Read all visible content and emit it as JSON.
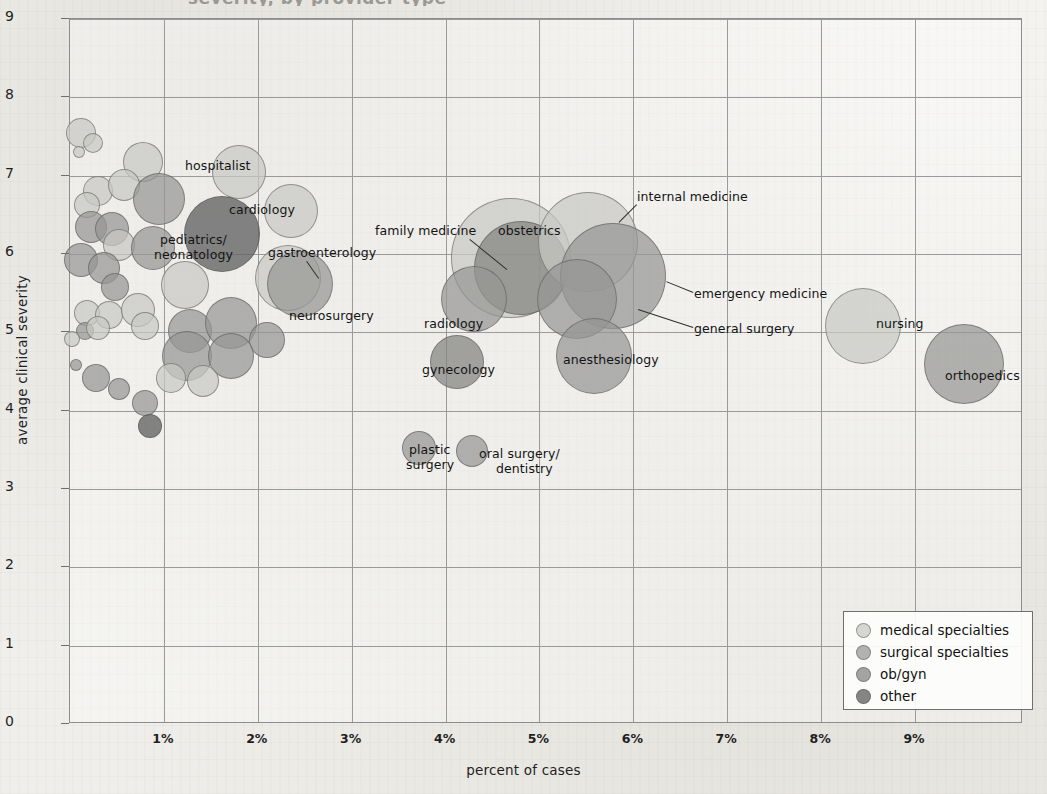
{
  "title_partial": "severity, by provider type",
  "axes": {
    "x": {
      "label": "percent of cases",
      "ticks": [
        "1%",
        "2%",
        "3%",
        "4%",
        "5%",
        "6%",
        "7%",
        "8%",
        "9%"
      ],
      "min": 0,
      "max": 10.15
    },
    "y": {
      "label": "average clinical severity",
      "ticks": [
        "0",
        "1",
        "2",
        "3",
        "4",
        "5",
        "6",
        "7",
        "8",
        "9"
      ],
      "min": 0,
      "max": 9
    }
  },
  "legend": {
    "items": [
      {
        "label": "medical specialties",
        "color": "#c8c8c4",
        "class": "c-med"
      },
      {
        "label": "surgical specialties",
        "color": "#969694",
        "class": "c-surg"
      },
      {
        "label": "ob/gyn",
        "color": "#828280",
        "class": "c-obgyn"
      },
      {
        "label": "other",
        "color": "#636363",
        "class": "c-other"
      }
    ]
  },
  "chart_data": {
    "type": "scatter",
    "title": "severity, by provider type",
    "xlabel": "percent of cases",
    "ylabel": "average clinical severity",
    "xlim": [
      0,
      10.15
    ],
    "ylim": [
      0,
      9
    ],
    "grid": true,
    "legend_position": "bottom-right",
    "size_encodes": "volume of cases",
    "groups": [
      "medical specialties",
      "surgical specialties",
      "ob/gyn",
      "other"
    ],
    "points": [
      {
        "label": "hospitalist",
        "x": 1.8,
        "y": 7.05,
        "r": 27,
        "group": "medical specialties",
        "cls": "c-med"
      },
      {
        "label": "cardiology",
        "x": 2.35,
        "y": 6.55,
        "r": 27,
        "group": "medical specialties",
        "cls": "c-med"
      },
      {
        "label": "pediatrics/\nneonatology",
        "x": 1.62,
        "y": 6.25,
        "r": 38,
        "group": "other",
        "cls": "c-other"
      },
      {
        "label": "gastroenterology",
        "x": 2.32,
        "y": 5.7,
        "r": 33,
        "group": "medical specialties",
        "cls": "c-med"
      },
      {
        "label": "neurosurgery",
        "x": 2.45,
        "y": 5.62,
        "r": 33,
        "group": "surgical specialties",
        "cls": "c-surg"
      },
      {
        "label": "family medicine",
        "x": 4.7,
        "y": 5.95,
        "r": 60,
        "group": "medical specialties",
        "cls": "c-med"
      },
      {
        "label": "obstetrics",
        "x": 4.8,
        "y": 5.82,
        "r": 47,
        "group": "ob/gyn",
        "cls": "c-obgyn"
      },
      {
        "label": "internal medicine",
        "x": 5.52,
        "y": 6.15,
        "r": 50,
        "group": "medical specialties",
        "cls": "c-med"
      },
      {
        "label": "emergency medicine",
        "x": 5.78,
        "y": 5.72,
        "r": 53,
        "group": "medical specialties",
        "cls": "c-surg"
      },
      {
        "label": "general surgery",
        "x": 5.4,
        "y": 5.42,
        "r": 40,
        "group": "surgical specialties",
        "cls": "c-surg"
      },
      {
        "label": "radiology",
        "x": 4.3,
        "y": 5.42,
        "r": 33,
        "group": "medical specialties",
        "cls": "c-surg"
      },
      {
        "label": "gynecology",
        "x": 4.12,
        "y": 4.62,
        "r": 27,
        "group": "ob/gyn",
        "cls": "c-obgyn"
      },
      {
        "label": "anesthesiology",
        "x": 5.58,
        "y": 4.7,
        "r": 38,
        "group": "surgical specialties",
        "cls": "c-surg"
      },
      {
        "label": "nursing",
        "x": 8.45,
        "y": 5.08,
        "r": 38,
        "group": "medical specialties",
        "cls": "c-med"
      },
      {
        "label": "orthopedics",
        "x": 9.52,
        "y": 4.6,
        "r": 40,
        "group": "surgical specialties",
        "cls": "c-surg"
      },
      {
        "label": "plastic\nsurgery",
        "x": 3.72,
        "y": 3.52,
        "r": 17,
        "group": "surgical specialties",
        "cls": "c-surg"
      },
      {
        "label": "oral surgery/\ndentistry",
        "x": 4.28,
        "y": 3.48,
        "r": 16,
        "group": "surgical specialties",
        "cls": "c-surg"
      },
      {
        "label": "",
        "x": 0.12,
        "y": 7.55,
        "r": 15,
        "group": "medical specialties",
        "cls": "c-med"
      },
      {
        "label": "",
        "x": 0.25,
        "y": 7.42,
        "r": 10,
        "group": "medical specialties",
        "cls": "c-med"
      },
      {
        "label": "",
        "x": 0.1,
        "y": 7.3,
        "r": 6,
        "group": "medical specialties",
        "cls": "c-med"
      },
      {
        "label": "",
        "x": 0.78,
        "y": 7.18,
        "r": 20,
        "group": "medical specialties",
        "cls": "c-med"
      },
      {
        "label": "",
        "x": 0.3,
        "y": 6.8,
        "r": 15,
        "group": "medical specialties",
        "cls": "c-med"
      },
      {
        "label": "",
        "x": 0.58,
        "y": 6.88,
        "r": 16,
        "group": "medical specialties",
        "cls": "c-med"
      },
      {
        "label": "",
        "x": 0.18,
        "y": 6.62,
        "r": 13,
        "group": "medical specialties",
        "cls": "c-med"
      },
      {
        "label": "",
        "x": 0.95,
        "y": 6.7,
        "r": 26,
        "group": "surgical specialties",
        "cls": "c-surg"
      },
      {
        "label": "",
        "x": 0.22,
        "y": 6.35,
        "r": 16,
        "group": "surgical specialties",
        "cls": "c-surg"
      },
      {
        "label": "",
        "x": 0.45,
        "y": 6.32,
        "r": 17,
        "group": "surgical specialties",
        "cls": "c-surg"
      },
      {
        "label": "",
        "x": 0.52,
        "y": 6.12,
        "r": 16,
        "group": "medical specialties",
        "cls": "c-med"
      },
      {
        "label": "",
        "x": 0.88,
        "y": 6.08,
        "r": 22,
        "group": "surgical specialties",
        "cls": "c-surg"
      },
      {
        "label": "",
        "x": 0.12,
        "y": 5.92,
        "r": 17,
        "group": "surgical specialties",
        "cls": "c-surg"
      },
      {
        "label": "",
        "x": 0.36,
        "y": 5.82,
        "r": 16,
        "group": "surgical specialties",
        "cls": "c-surg"
      },
      {
        "label": "",
        "x": 0.48,
        "y": 5.58,
        "r": 14,
        "group": "surgical specialties",
        "cls": "c-surg"
      },
      {
        "label": "",
        "x": 1.22,
        "y": 5.6,
        "r": 24,
        "group": "medical specialties",
        "cls": "c-med"
      },
      {
        "label": "",
        "x": 0.18,
        "y": 5.25,
        "r": 13,
        "group": "medical specialties",
        "cls": "c-med"
      },
      {
        "label": "",
        "x": 0.42,
        "y": 5.22,
        "r": 14,
        "group": "medical specialties",
        "cls": "c-med"
      },
      {
        "label": "",
        "x": 0.72,
        "y": 5.28,
        "r": 17,
        "group": "medical specialties",
        "cls": "c-med"
      },
      {
        "label": "",
        "x": 0.8,
        "y": 5.08,
        "r": 14,
        "group": "medical specialties",
        "cls": "c-med"
      },
      {
        "label": "",
        "x": 0.16,
        "y": 5.02,
        "r": 9,
        "group": "surgical specialties",
        "cls": "c-surg"
      },
      {
        "label": "",
        "x": 0.3,
        "y": 5.05,
        "r": 12,
        "group": "medical specialties",
        "cls": "c-med"
      },
      {
        "label": "",
        "x": 0.02,
        "y": 4.92,
        "r": 8,
        "group": "medical specialties",
        "cls": "c-med"
      },
      {
        "label": "",
        "x": 1.28,
        "y": 5.02,
        "r": 22,
        "group": "surgical specialties",
        "cls": "c-surg"
      },
      {
        "label": "",
        "x": 1.72,
        "y": 5.12,
        "r": 26,
        "group": "surgical specialties",
        "cls": "c-surg"
      },
      {
        "label": "",
        "x": 2.1,
        "y": 4.9,
        "r": 18,
        "group": "surgical specialties",
        "cls": "c-surg"
      },
      {
        "label": "",
        "x": 1.25,
        "y": 4.7,
        "r": 25,
        "group": "surgical specialties",
        "cls": "c-surg"
      },
      {
        "label": "",
        "x": 1.72,
        "y": 4.7,
        "r": 23,
        "group": "surgical specialties",
        "cls": "c-surg"
      },
      {
        "label": "",
        "x": 0.06,
        "y": 4.58,
        "r": 6,
        "group": "surgical specialties",
        "cls": "c-surg"
      },
      {
        "label": "",
        "x": 0.28,
        "y": 4.42,
        "r": 14,
        "group": "surgical specialties",
        "cls": "c-surg"
      },
      {
        "label": "",
        "x": 0.52,
        "y": 4.28,
        "r": 11,
        "group": "surgical specialties",
        "cls": "c-surg"
      },
      {
        "label": "",
        "x": 0.8,
        "y": 4.1,
        "r": 13,
        "group": "surgical specialties",
        "cls": "c-surg"
      },
      {
        "label": "",
        "x": 1.08,
        "y": 4.42,
        "r": 15,
        "group": "medical specialties",
        "cls": "c-med"
      },
      {
        "label": "",
        "x": 1.42,
        "y": 4.38,
        "r": 16,
        "group": "medical specialties",
        "cls": "c-med"
      },
      {
        "label": "",
        "x": 0.85,
        "y": 3.8,
        "r": 12,
        "group": "other",
        "cls": "c-other"
      }
    ]
  },
  "annotations": [
    {
      "text": "hospitalist",
      "x": 185,
      "y": 159,
      "align": "left",
      "leader": null
    },
    {
      "text": "cardiology",
      "x": 229,
      "y": 203,
      "align": "left",
      "leader": null
    },
    {
      "text": "pediatrics/",
      "x": 160,
      "y": 233,
      "align": "left",
      "leader": null
    },
    {
      "text": "neonatology",
      "x": 154,
      "y": 248,
      "align": "left",
      "leader": null
    },
    {
      "text": "gastroenterology",
      "x": 268,
      "y": 246,
      "align": "left",
      "leader": {
        "x1": 306,
        "y1": 260,
        "x2": 318,
        "y2": 277
      }
    },
    {
      "text": "neurosurgery",
      "x": 289,
      "y": 309,
      "align": "left",
      "leader": null
    },
    {
      "text": "family medicine",
      "x": 375,
      "y": 224,
      "align": "left",
      "leader": {
        "x1": 469,
        "y1": 238,
        "x2": 506,
        "y2": 268
      }
    },
    {
      "text": "obstetrics",
      "x": 498,
      "y": 224,
      "align": "left",
      "leader": null
    },
    {
      "text": "internal medicine",
      "x": 637,
      "y": 190,
      "align": "left",
      "leader": {
        "x1": 636,
        "y1": 204,
        "x2": 618,
        "y2": 222
      }
    },
    {
      "text": "emergency medicine",
      "x": 694,
      "y": 287,
      "align": "left",
      "leader": {
        "x1": 692,
        "y1": 292,
        "x2": 665,
        "y2": 281
      }
    },
    {
      "text": "general surgery",
      "x": 694,
      "y": 322,
      "align": "left",
      "leader": {
        "x1": 692,
        "y1": 327,
        "x2": 637,
        "y2": 309
      }
    },
    {
      "text": "radiology",
      "x": 424,
      "y": 317,
      "align": "left",
      "leader": null
    },
    {
      "text": "gynecology",
      "x": 422,
      "y": 363,
      "align": "left",
      "leader": null
    },
    {
      "text": "anesthesiology",
      "x": 563,
      "y": 353,
      "align": "left",
      "leader": null
    },
    {
      "text": "nursing",
      "x": 876,
      "y": 317,
      "align": "left",
      "leader": null
    },
    {
      "text": "orthopedics",
      "x": 945,
      "y": 369,
      "align": "left",
      "leader": null
    },
    {
      "text": "plastic",
      "x": 409,
      "y": 443,
      "align": "left",
      "leader": null
    },
    {
      "text": "surgery",
      "x": 406,
      "y": 458,
      "align": "left",
      "leader": null
    },
    {
      "text": "oral surgery/",
      "x": 479,
      "y": 447,
      "align": "left",
      "leader": null
    },
    {
      "text": "dentistry",
      "x": 496,
      "y": 462,
      "align": "left",
      "leader": null
    }
  ]
}
